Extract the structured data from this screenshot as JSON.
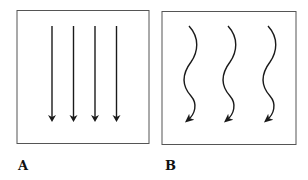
{
  "panels": [
    {
      "label": "A",
      "description": "straight parallel downward arrows",
      "arrow_count": 4
    },
    {
      "label": "B",
      "description": "wavy downward arrows",
      "arrow_count": 3
    }
  ],
  "colors": {
    "line": "#1a1a1a",
    "border": "#555555"
  }
}
